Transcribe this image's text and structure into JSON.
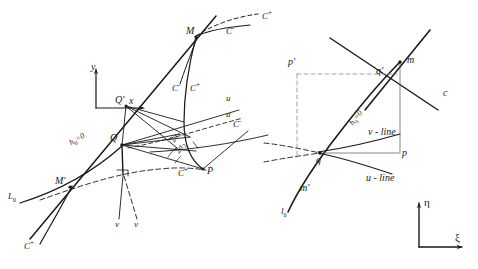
{
  "figure": {
    "stroke_color": "#1a1a1a",
    "background_color": "#ffffff"
  },
  "left_panel": {
    "axes": {
      "y_label": "y",
      "x_label": "x"
    },
    "points": [
      {
        "id": "M",
        "label": "M",
        "x": 196,
        "y": 35
      },
      {
        "id": "Qp",
        "label": "Q'",
        "x": 123,
        "y": 104
      },
      {
        "id": "Q",
        "label": "Q",
        "x": 120,
        "y": 143
      },
      {
        "id": "P",
        "label": "P",
        "x": 205,
        "y": 170
      },
      {
        "id": "Mp",
        "label": "M'",
        "x": 60,
        "y": 187
      }
    ],
    "curve_labels": [
      {
        "id": "c-plus-top",
        "text": "C",
        "sup": "+",
        "x": 264,
        "y": 16
      },
      {
        "id": "c-minus-top",
        "text": "C",
        "sup": "-",
        "x": 228,
        "y": 31
      },
      {
        "id": "c-minus-mid",
        "text": "C",
        "sup": "-",
        "x": 177,
        "y": 88
      },
      {
        "id": "c-plus-mid",
        "text": "C",
        "sup": "+",
        "x": 195,
        "y": 88
      },
      {
        "id": "c-minus-right",
        "text": "C",
        "sup": "-",
        "x": 234,
        "y": 124
      },
      {
        "id": "c-plus-p",
        "text": "C",
        "sup": "+",
        "x": 182,
        "y": 172
      },
      {
        "id": "c-plus-bottom",
        "text": "C",
        "sup": "+",
        "x": 26,
        "y": 245
      }
    ],
    "line_labels": [
      {
        "id": "u-upper",
        "text": "u",
        "x": 228,
        "y": 100
      },
      {
        "id": "u-lower",
        "text": "u",
        "x": 228,
        "y": 116
      },
      {
        "id": "v-left",
        "text": "v",
        "x": 118,
        "y": 225
      },
      {
        "id": "v-right",
        "text": "v",
        "x": 136,
        "y": 225
      },
      {
        "id": "L0",
        "text": "L",
        "sub": "0",
        "x": 10,
        "y": 198
      },
      {
        "id": "h0-eq-0",
        "text": "h",
        "sub": "0",
        "eq": "=0",
        "x": 72,
        "y": 146
      }
    ],
    "angle_labels": [
      {
        "id": "angle-2alpha-1",
        "text": "2α",
        "sub": "1",
        "x": 173,
        "y": 146
      },
      {
        "id": "angle-2alpha-2",
        "text": "2α",
        "sub": "2",
        "x": 178,
        "y": 156
      }
    ]
  },
  "right_panel": {
    "axes": {
      "eta_label": "η",
      "xi_label": "ξ"
    },
    "points": [
      {
        "id": "m",
        "label": "m",
        "x": 405,
        "y": 62
      },
      {
        "id": "qp",
        "label": "q'",
        "x": 378,
        "y": 73
      },
      {
        "id": "pp",
        "label": "p'",
        "x": 291,
        "y": 63
      },
      {
        "id": "q",
        "label": "q",
        "x": 318,
        "y": 158
      },
      {
        "id": "p",
        "label": "p",
        "x": 400,
        "y": 153
      },
      {
        "id": "mp",
        "label": "m'",
        "x": 303,
        "y": 188
      }
    ],
    "curve_labels": [
      {
        "id": "c-right",
        "text": "c",
        "x": 444,
        "y": 95
      },
      {
        "id": "h0-eq-0r",
        "text": "h",
        "sub": "0",
        "eq": "=0",
        "x": 352,
        "y": 128
      },
      {
        "id": "v-line",
        "text": "v - line",
        "x": 378,
        "y": 133
      },
      {
        "id": "u-line",
        "text": "u - line",
        "x": 372,
        "y": 178
      },
      {
        "id": "l0",
        "text": "l",
        "sub": "0",
        "x": 283,
        "y": 213
      }
    ]
  }
}
